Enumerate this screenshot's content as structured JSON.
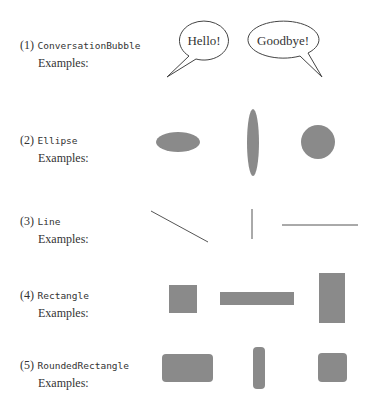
{
  "colors": {
    "shape_fill": "#8a8a8a",
    "stroke": "#444444"
  },
  "sections": [
    {
      "number": "(1)",
      "name": "ConversationBubble",
      "examples_label": "Examples:"
    },
    {
      "number": "(2)",
      "name": "Ellipse",
      "examples_label": "Examples:"
    },
    {
      "number": "(3)",
      "name": "Line",
      "examples_label": "Examples:"
    },
    {
      "number": "(4)",
      "name": "Rectangle",
      "examples_label": "Examples:"
    },
    {
      "number": "(5)",
      "name": "RoundedRectangle",
      "examples_label": "Examples:"
    }
  ],
  "bubbles": [
    {
      "text": "Hello!"
    },
    {
      "text": "Goodbye!"
    }
  ]
}
